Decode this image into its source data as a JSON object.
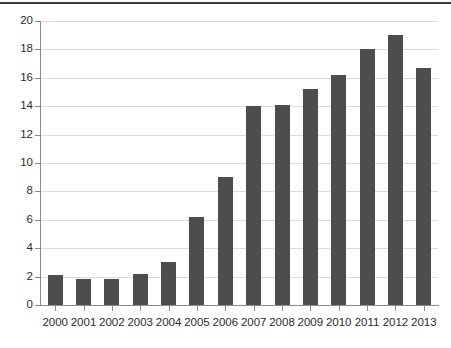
{
  "chart_data": {
    "type": "bar",
    "title": "",
    "subtitle": "",
    "xlabel": "",
    "ylabel": "",
    "categories": [
      "2000",
      "2001",
      "2002",
      "2003",
      "2004",
      "2005",
      "2006",
      "2007",
      "2008",
      "2009",
      "2010",
      "2011",
      "2012",
      "2013"
    ],
    "values": [
      2.1,
      1.8,
      1.8,
      2.2,
      3.0,
      6.2,
      9.0,
      14.0,
      14.1,
      15.2,
      16.2,
      18.0,
      19.0,
      16.7
    ],
    "series": [
      {
        "name": "",
        "values": [
          2.1,
          1.8,
          1.8,
          2.2,
          3.0,
          6.2,
          9.0,
          14.0,
          14.1,
          15.2,
          16.2,
          18.0,
          19.0,
          16.7
        ]
      }
    ],
    "ylim": [
      0,
      20
    ],
    "ytick_values": [
      0,
      2,
      4,
      6,
      8,
      10,
      12,
      14,
      16,
      18,
      20
    ],
    "ytick_labels": [
      "0",
      "2",
      "4",
      "6",
      "8",
      "10",
      "12",
      "14",
      "16",
      "18",
      "20"
    ],
    "xtick_labels": [
      "2000",
      "2001",
      "2002",
      "2003",
      "2004",
      "2005",
      "2006",
      "2007",
      "2008",
      "2009",
      "2010",
      "2011",
      "2012",
      "2013"
    ],
    "grid": true,
    "grid_axis": "y",
    "legend": false,
    "legend_position": "none",
    "annotations": [],
    "colors": {
      "bar": "#4d4d4d",
      "gridline": "#dcdcdc",
      "axis": "#8a8a8a",
      "text": "#2b2b2b",
      "background": "#ffffff",
      "top_rule": "#3c3c3c"
    }
  },
  "figure": {
    "top_rule_visible": true
  }
}
